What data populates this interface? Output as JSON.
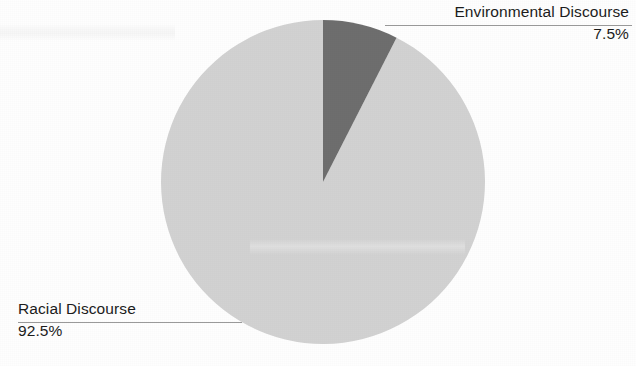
{
  "chart_data": {
    "type": "pie",
    "title": "",
    "labels": [
      "Environmental Discourse",
      "Racial Discourse"
    ],
    "values": [
      7.5,
      92.5
    ],
    "value_labels": [
      "7.5%",
      "92.5%"
    ],
    "units": "percent",
    "total": 100,
    "start_angle_deg": 0,
    "direction": "clockwise",
    "legend": "none",
    "annotations": [
      {
        "label": "Environmental Discourse",
        "value_label": "7.5%",
        "position": "top-right",
        "align": "right",
        "leader_line": true
      },
      {
        "label": "Racial Discourse",
        "value_label": "92.5%",
        "position": "bottom-left",
        "align": "left",
        "leader_line": true
      }
    ],
    "slices": [
      {
        "name": "Environmental Discourse",
        "value": 7.5,
        "value_label": "7.5%",
        "color": "#6e6e6e",
        "sweep_deg": 27
      },
      {
        "name": "Racial Discourse",
        "value": 92.5,
        "value_label": "92.5%",
        "color": "#d2d2d2",
        "sweep_deg": 333
      }
    ],
    "geometry": {
      "center_x": 323,
      "center_y": 182,
      "radius": 162
    },
    "colors": {
      "background": "#fefefe",
      "slice_light": "#d2d2d2",
      "slice_dark": "#6e6e6e",
      "leader_line": "#9a9a9a",
      "text": "#1c1c1c"
    }
  },
  "labels": {
    "environmental": {
      "name": "Environmental Discourse",
      "value": "7.5%"
    },
    "racial": {
      "name": "Racial Discourse",
      "value": "92.5%"
    }
  }
}
